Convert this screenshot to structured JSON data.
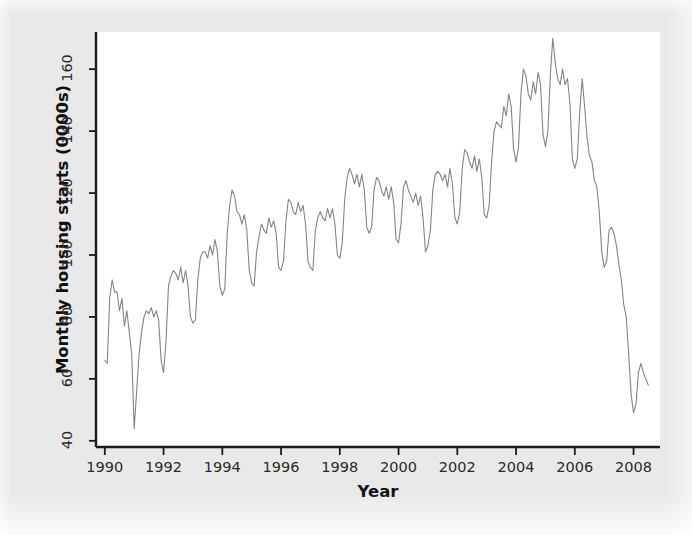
{
  "figure": {
    "background_color": "#e9e9e9",
    "plot_background_color": "#ffffff",
    "axis_color": "#1a1a1a",
    "line_color": "#848484"
  },
  "axis_titles": {
    "y": "Monthly housing starts (0000s)",
    "x": "Year"
  },
  "chart_data": {
    "type": "line",
    "title": "",
    "subtitle": "",
    "xlabel": "Year",
    "ylabel": "Monthly housing starts (0000s)",
    "xlim": [
      1989.7,
      2008.9
    ],
    "ylim": [
      38,
      172
    ],
    "xticks": [
      1990,
      1992,
      1994,
      1996,
      1998,
      2000,
      2002,
      2004,
      2006,
      2008
    ],
    "xtick_labels": [
      "1990",
      "1992",
      "1994",
      "1996",
      "1998",
      "2000",
      "2002",
      "2004",
      "2006",
      "2008"
    ],
    "yticks": [
      40,
      60,
      80,
      100,
      120,
      140,
      160
    ],
    "ytick_labels": [
      "40",
      "60",
      "80",
      "100",
      "120",
      "140",
      "160"
    ],
    "grid": false,
    "legend": null,
    "legend_position": "none",
    "series": [
      {
        "name": "Monthly housing starts",
        "color": "#848484",
        "line_width": 1.1,
        "x_start": 1990.0,
        "x_step": 0.0833333,
        "values": [
          66,
          65,
          86,
          92,
          88,
          88,
          82,
          86,
          77,
          82,
          75,
          68,
          44,
          56,
          68,
          75,
          80,
          82,
          81,
          83,
          80,
          82,
          79,
          66,
          62,
          72,
          90,
          93,
          95,
          94,
          92,
          96,
          91,
          95,
          90,
          80,
          78,
          79,
          92,
          99,
          101,
          101,
          99,
          103,
          100,
          105,
          101,
          90,
          87,
          89,
          107,
          116,
          121,
          119,
          114,
          113,
          110,
          113,
          108,
          95,
          91,
          90,
          101,
          106,
          110,
          108,
          107,
          112,
          109,
          111,
          107,
          96,
          95,
          98,
          111,
          118,
          117,
          114,
          113,
          117,
          114,
          116,
          110,
          98,
          96,
          95,
          108,
          112,
          114,
          112,
          111,
          115,
          112,
          115,
          110,
          100,
          99,
          104,
          118,
          125,
          128,
          126,
          123,
          126,
          122,
          126,
          121,
          109,
          107,
          109,
          121,
          125,
          124,
          121,
          119,
          122,
          118,
          122,
          117,
          105,
          104,
          110,
          122,
          124,
          121,
          119,
          117,
          120,
          116,
          119,
          112,
          101,
          103,
          108,
          121,
          126,
          127,
          126,
          124,
          126,
          122,
          128,
          123,
          112,
          110,
          114,
          128,
          134,
          133,
          130,
          128,
          132,
          127,
          131,
          125,
          113,
          112,
          116,
          130,
          140,
          143,
          142,
          141,
          148,
          145,
          152,
          148,
          134,
          130,
          135,
          152,
          160,
          158,
          152,
          150,
          156,
          152,
          159,
          155,
          139,
          135,
          140,
          158,
          170,
          162,
          157,
          155,
          160,
          155,
          157,
          149,
          131,
          128,
          131,
          146,
          157,
          148,
          138,
          132,
          130,
          124,
          122,
          114,
          101,
          96,
          98,
          108,
          109,
          107,
          103,
          97,
          92,
          84,
          80,
          68,
          55,
          49,
          52,
          62,
          65,
          62,
          60,
          58
        ]
      }
    ]
  }
}
